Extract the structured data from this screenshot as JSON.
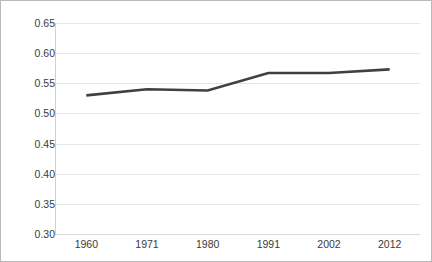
{
  "chart_data": {
    "type": "line",
    "title": "",
    "subtitle": "",
    "xlabel": "",
    "ylabel": "",
    "categories": [
      "1960",
      "1971",
      "1980",
      "1991",
      "2002",
      "2012"
    ],
    "x": [
      1960,
      1971,
      1980,
      1991,
      2002,
      2012
    ],
    "values": [
      0.53,
      0.54,
      0.538,
      0.567,
      0.567,
      0.573
    ],
    "series": [
      {
        "name": "series-1",
        "values": [
          0.53,
          0.54,
          0.538,
          0.567,
          0.567,
          0.573
        ]
      }
    ],
    "ylim": [
      0.3,
      0.65
    ],
    "ytick_step": 0.05,
    "ytick_labels": [
      "0.65",
      "0.60",
      "0.55",
      "0.50",
      "0.45",
      "0.40",
      "0.35",
      "0.30"
    ],
    "ytick_values": [
      0.65,
      0.6,
      0.55,
      0.5,
      0.45,
      0.4,
      0.35,
      0.3
    ],
    "xtick_labels": [
      "1960",
      "1971",
      "1980",
      "1991",
      "2002",
      "2012"
    ],
    "grid": {
      "horizontal": true,
      "vertical": false,
      "color": "#e6e6e6"
    },
    "legend": {
      "visible": false,
      "position": "none",
      "entries": []
    },
    "markers": false,
    "line_color": "#404040",
    "line_width": 2.6,
    "annotations": [],
    "plot_background": "#ffffff",
    "border_color": "#b9b9b9"
  }
}
